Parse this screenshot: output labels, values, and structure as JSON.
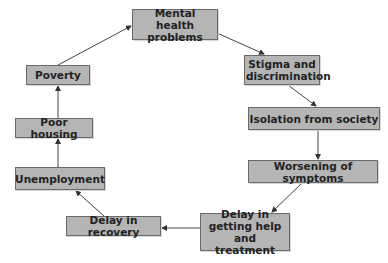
{
  "diagram": {
    "type": "cycle",
    "nodes": [
      {
        "id": "mental",
        "label": "Mental health problems",
        "lines": [
          "Mental health",
          "problems"
        ]
      },
      {
        "id": "stigma",
        "label": "Stigma and discrimination",
        "lines": [
          "Stigma and",
          "discrimination"
        ]
      },
      {
        "id": "isolation",
        "label": "Isolation from society",
        "lines": [
          "Isolation from society"
        ]
      },
      {
        "id": "worsening",
        "label": "Worsening of symptoms",
        "lines": [
          "Worsening of symptoms"
        ]
      },
      {
        "id": "delayhelp",
        "label": "Delay in getting help and treatment",
        "lines": [
          "Delay in getting",
          "help and",
          "treatment"
        ]
      },
      {
        "id": "delayrecovery",
        "label": "Delay in recovery",
        "lines": [
          "Delay in recovery"
        ]
      },
      {
        "id": "unemployment",
        "label": "Unemployment",
        "lines": [
          "Unemployment"
        ]
      },
      {
        "id": "housing",
        "label": "Poor housing",
        "lines": [
          "Poor housing"
        ]
      },
      {
        "id": "poverty",
        "label": "Poverty",
        "lines": [
          "Poverty"
        ]
      }
    ],
    "edges": [
      [
        "mental",
        "stigma"
      ],
      [
        "stigma",
        "isolation"
      ],
      [
        "isolation",
        "worsening"
      ],
      [
        "worsening",
        "delayhelp"
      ],
      [
        "delayhelp",
        "delayrecovery"
      ],
      [
        "delayrecovery",
        "unemployment"
      ],
      [
        "unemployment",
        "housing"
      ],
      [
        "housing",
        "poverty"
      ],
      [
        "poverty",
        "mental"
      ]
    ],
    "colors": {
      "box": "#b5b5b5",
      "border": "#6a6a6a",
      "arrow": "#333333"
    }
  }
}
